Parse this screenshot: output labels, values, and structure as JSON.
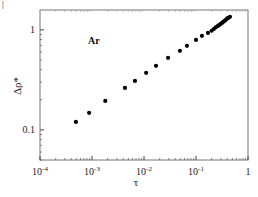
{
  "chart_data": {
    "type": "scatter",
    "title": "",
    "annotation": "Ar",
    "xlabel": "τ",
    "ylabel": "Δρ*",
    "xscale": "log",
    "yscale": "log",
    "xlim": [
      0.0001,
      1
    ],
    "ylim": [
      0.05,
      1.58
    ],
    "grid": false,
    "legend": null,
    "x_ticks": [
      {
        "value": 0.0001,
        "base": "10",
        "exp": "-4"
      },
      {
        "value": 0.001,
        "base": "10",
        "exp": "-3"
      },
      {
        "value": 0.01,
        "base": "10",
        "exp": "-2"
      },
      {
        "value": 0.1,
        "base": "10",
        "exp": "-1"
      },
      {
        "value": 1,
        "base": "1",
        "exp": ""
      }
    ],
    "y_ticks": [
      {
        "value": 0.1,
        "label": "0.1"
      },
      {
        "value": 1,
        "label": "1"
      }
    ],
    "series": [
      {
        "name": "Ar",
        "marker": "filled-circle",
        "color": "#000000",
        "x": [
          0.00049,
          0.00088,
          0.0018,
          0.0043,
          0.0067,
          0.011,
          0.017,
          0.029,
          0.049,
          0.067,
          0.1,
          0.13,
          0.17,
          0.2,
          0.22,
          0.24,
          0.26,
          0.28,
          0.3,
          0.32,
          0.34,
          0.36,
          0.38,
          0.4,
          0.42,
          0.45
        ],
        "y": [
          0.12,
          0.148,
          0.195,
          0.263,
          0.309,
          0.372,
          0.437,
          0.525,
          0.617,
          0.692,
          0.794,
          0.871,
          0.933,
          0.98,
          1.02,
          1.06,
          1.09,
          1.12,
          1.15,
          1.18,
          1.21,
          1.24,
          1.27,
          1.3,
          1.32,
          1.35
        ]
      }
    ]
  },
  "corner_mark": "|"
}
